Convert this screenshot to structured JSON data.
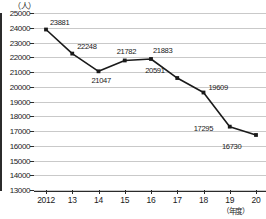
{
  "chart_data": {
    "type": "line",
    "title": "",
    "xlabel": "（年度）",
    "ylabel": "（人）",
    "categories": [
      "2012",
      "13",
      "14",
      "15",
      "16",
      "17",
      "18",
      "19",
      "20"
    ],
    "values": [
      23881,
      22248,
      21047,
      21782,
      21883,
      20591,
      19609,
      17295,
      16730
    ],
    "point_labels": [
      "23881",
      "22248",
      "21047",
      "21782",
      "21883",
      "20591",
      "19609",
      "17295",
      "16730"
    ],
    "ylim": [
      13000,
      25000
    ],
    "ytick_labels": [
      "25000",
      "24000",
      "23000",
      "22000",
      "21000",
      "20000",
      "19000",
      "18000",
      "17000",
      "16000",
      "15000",
      "14000",
      "13000"
    ],
    "ytick_values": [
      25000,
      24000,
      23000,
      22000,
      21000,
      20000,
      19000,
      18000,
      17000,
      16000,
      15000,
      14000,
      13000
    ],
    "grid": true,
    "legend": "none",
    "series_color": "#1a1a1a",
    "grid_color": "#c9c9c9",
    "axis_color": "#2b2b2b"
  }
}
